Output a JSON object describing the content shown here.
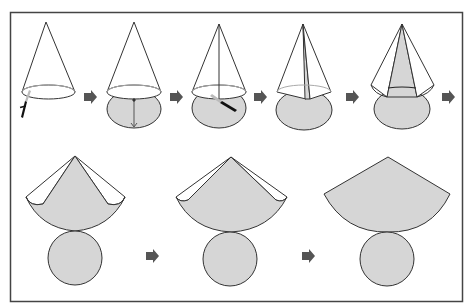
{
  "diagram": {
    "title": "",
    "colors": {
      "fill": "#d6d6d6",
      "stroke": "#333333",
      "arrow": "#555555",
      "knife": "#111111",
      "frame": "#444444",
      "background": "#ffffff"
    },
    "steps": [
      {
        "id": 1,
        "label": "cone-with-knife-cutting-base"
      },
      {
        "id": 2,
        "label": "base-cut-and-folded-down"
      },
      {
        "id": 3,
        "label": "knife-cutting-slant-line"
      },
      {
        "id": 4,
        "label": "cone-slit-opened"
      },
      {
        "id": 5,
        "label": "lateral-surface-opening"
      },
      {
        "id": 6,
        "label": "lateral-surface-partly-unrolled"
      },
      {
        "id": 7,
        "label": "lateral-surface-nearly-unrolled"
      },
      {
        "id": 8,
        "label": "full-net-sector-and-circle"
      }
    ],
    "arrows": 6
  }
}
